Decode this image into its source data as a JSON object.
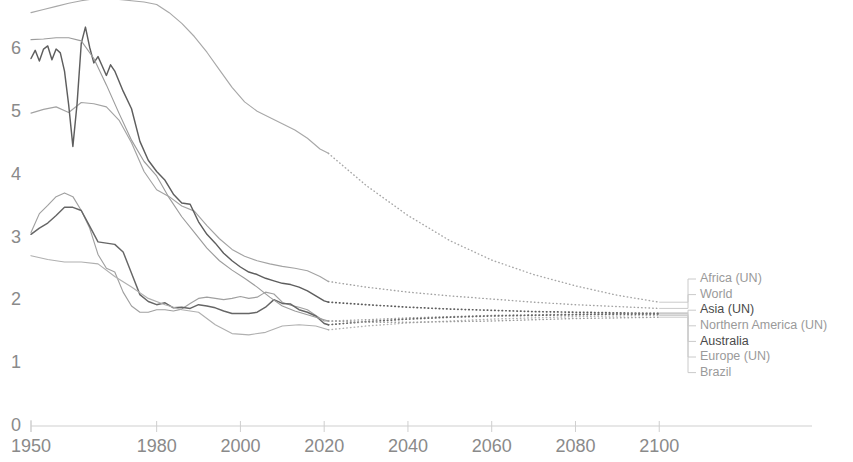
{
  "chart_data": {
    "type": "line",
    "title": "",
    "subtitle": "",
    "xlabel": "",
    "ylabel": "",
    "xlim": [
      1950,
      2104
    ],
    "ylim": [
      0,
      6.55
    ],
    "grid": false,
    "legend_position": "right",
    "x_ticks": [
      1950,
      1980,
      2000,
      2020,
      2040,
      2060,
      2080,
      2100
    ],
    "x_tick_labels": [
      "1950",
      "1980",
      "2000",
      "2020",
      "2040",
      "2060",
      "2080",
      "2100"
    ],
    "y_ticks": [
      0,
      1,
      2,
      3,
      4,
      5,
      6
    ],
    "y_tick_labels": [
      "0",
      "1",
      "2",
      "3",
      "4",
      "5",
      "6"
    ],
    "projection_start_year": 2021,
    "annotations": [
      "Solid lines show historical estimates; dotted lines show UN projections"
    ],
    "series": [
      {
        "name": "Africa (UN)",
        "label": "Africa (UN)",
        "color": "#a8a8a8",
        "emphasis": false,
        "x": [
          1950,
          1953,
          1956,
          1959,
          1962,
          1965,
          1968,
          1971,
          1974,
          1977,
          1980,
          1983,
          1986,
          1989,
          1992,
          1995,
          1998,
          2001,
          2004,
          2007,
          2010,
          2013,
          2016,
          2019,
          2021
        ],
        "values": [
          6.55,
          6.6,
          6.65,
          6.7,
          6.74,
          6.77,
          6.78,
          6.76,
          6.74,
          6.72,
          6.68,
          6.55,
          6.38,
          6.17,
          5.92,
          5.64,
          5.36,
          5.13,
          4.98,
          4.88,
          4.78,
          4.68,
          4.55,
          4.38,
          4.31
        ],
        "projection_x": [
          2021,
          2030,
          2040,
          2050,
          2060,
          2070,
          2080,
          2090,
          2100
        ],
        "projection_values": [
          4.31,
          3.8,
          3.32,
          2.92,
          2.61,
          2.38,
          2.2,
          2.05,
          1.94
        ]
      },
      {
        "name": "World",
        "label": "World",
        "color": "#a3a3a3",
        "emphasis": false,
        "x": [
          1950,
          1953,
          1956,
          1959,
          1962,
          1965,
          1968,
          1971,
          1974,
          1977,
          1980,
          1983,
          1986,
          1989,
          1992,
          1995,
          1998,
          2001,
          2004,
          2007,
          2010,
          2013,
          2016,
          2019,
          2021
        ],
        "values": [
          4.95,
          5.01,
          5.05,
          4.96,
          5.12,
          5.1,
          5.05,
          4.84,
          4.48,
          4.02,
          3.73,
          3.62,
          3.47,
          3.39,
          3.16,
          2.95,
          2.78,
          2.67,
          2.6,
          2.55,
          2.51,
          2.48,
          2.44,
          2.35,
          2.27
        ],
        "projection_x": [
          2021,
          2030,
          2040,
          2050,
          2060,
          2070,
          2080,
          2090,
          2100
        ],
        "projection_values": [
          2.27,
          2.18,
          2.1,
          2.04,
          1.99,
          1.94,
          1.9,
          1.87,
          1.84
        ]
      },
      {
        "name": "Asia (UN)",
        "label": "Asia (UN)",
        "color": "#5e5e5e",
        "emphasis": true,
        "x": [
          1950,
          1951,
          1952,
          1953,
          1954,
          1955,
          1956,
          1957,
          1958,
          1959,
          1960,
          1961,
          1962,
          1963,
          1964,
          1965,
          1966,
          1967,
          1968,
          1969,
          1970,
          1972,
          1974,
          1976,
          1978,
          1980,
          1982,
          1984,
          1986,
          1988,
          1990,
          1992,
          1994,
          1996,
          1998,
          2000,
          2002,
          2004,
          2006,
          2008,
          2010,
          2012,
          2014,
          2016,
          2018,
          2020,
          2021
        ],
        "values": [
          5.82,
          5.95,
          5.78,
          5.97,
          6.02,
          5.8,
          5.97,
          5.91,
          5.62,
          5.08,
          4.42,
          5.1,
          6.06,
          6.32,
          6.0,
          5.75,
          5.85,
          5.7,
          5.55,
          5.72,
          5.62,
          5.3,
          5.02,
          4.5,
          4.2,
          4.02,
          3.88,
          3.66,
          3.52,
          3.5,
          3.22,
          3.02,
          2.88,
          2.72,
          2.6,
          2.5,
          2.42,
          2.38,
          2.32,
          2.28,
          2.24,
          2.22,
          2.18,
          2.12,
          2.04,
          1.96,
          1.94
        ],
        "projection_x": [
          2021,
          2030,
          2040,
          2050,
          2060,
          2070,
          2080,
          2090,
          2100
        ],
        "projection_values": [
          1.94,
          1.9,
          1.86,
          1.83,
          1.81,
          1.79,
          1.78,
          1.77,
          1.76
        ]
      },
      {
        "name": "Northern America (UN)",
        "label": "Northern America (UN)",
        "color": "#a0a0a0",
        "emphasis": false,
        "x": [
          1950,
          1952,
          1954,
          1956,
          1958,
          1960,
          1962,
          1964,
          1966,
          1968,
          1970,
          1972,
          1974,
          1976,
          1978,
          1980,
          1982,
          1984,
          1986,
          1988,
          1990,
          1992,
          1994,
          1996,
          1998,
          2000,
          2002,
          2004,
          2006,
          2008,
          2010,
          2012,
          2014,
          2016,
          2018,
          2020,
          2021
        ],
        "values": [
          3.05,
          3.35,
          3.48,
          3.62,
          3.68,
          3.62,
          3.4,
          3.12,
          2.7,
          2.48,
          2.42,
          2.1,
          1.88,
          1.78,
          1.78,
          1.82,
          1.82,
          1.8,
          1.83,
          1.92,
          2.0,
          2.02,
          2.0,
          1.98,
          2.0,
          2.03,
          2.0,
          2.02,
          2.1,
          2.07,
          1.94,
          1.89,
          1.86,
          1.82,
          1.73,
          1.64,
          1.64
        ],
        "projection_x": [
          2021,
          2030,
          2040,
          2050,
          2060,
          2070,
          2080,
          2090,
          2100
        ],
        "projection_values": [
          1.64,
          1.66,
          1.69,
          1.71,
          1.73,
          1.74,
          1.75,
          1.76,
          1.77
        ]
      },
      {
        "name": "Australia",
        "label": "Australia",
        "color": "#666666",
        "emphasis": true,
        "x": [
          1950,
          1952,
          1954,
          1956,
          1958,
          1960,
          1962,
          1964,
          1966,
          1968,
          1970,
          1972,
          1974,
          1976,
          1978,
          1980,
          1982,
          1984,
          1986,
          1988,
          1990,
          1992,
          1994,
          1996,
          1998,
          2000,
          2002,
          2004,
          2006,
          2008,
          2010,
          2012,
          2014,
          2016,
          2018,
          2020,
          2021
        ],
        "values": [
          3.02,
          3.12,
          3.2,
          3.32,
          3.45,
          3.45,
          3.4,
          3.15,
          2.9,
          2.88,
          2.86,
          2.74,
          2.4,
          2.06,
          1.95,
          1.9,
          1.93,
          1.85,
          1.86,
          1.84,
          1.9,
          1.88,
          1.85,
          1.8,
          1.76,
          1.76,
          1.76,
          1.78,
          1.86,
          1.98,
          1.92,
          1.91,
          1.82,
          1.78,
          1.72,
          1.6,
          1.58
        ],
        "projection_x": [
          2021,
          2030,
          2040,
          2050,
          2060,
          2070,
          2080,
          2090,
          2100
        ],
        "projection_values": [
          1.58,
          1.63,
          1.67,
          1.7,
          1.72,
          1.73,
          1.74,
          1.75,
          1.75
        ]
      },
      {
        "name": "Europe (UN)",
        "label": "Europe (UN)",
        "color": "#b0b0b0",
        "emphasis": false,
        "x": [
          1950,
          1954,
          1958,
          1962,
          1966,
          1970,
          1974,
          1978,
          1982,
          1986,
          1990,
          1994,
          1998,
          2002,
          2006,
          2010,
          2014,
          2018,
          2021
        ],
        "values": [
          2.68,
          2.62,
          2.58,
          2.58,
          2.55,
          2.35,
          2.18,
          2.0,
          1.9,
          1.82,
          1.78,
          1.58,
          1.44,
          1.42,
          1.46,
          1.56,
          1.58,
          1.56,
          1.5
        ],
        "projection_x": [
          2021,
          2030,
          2040,
          2050,
          2060,
          2070,
          2080,
          2090,
          2100
        ],
        "projection_values": [
          1.5,
          1.56,
          1.61,
          1.64,
          1.67,
          1.69,
          1.71,
          1.72,
          1.73
        ]
      },
      {
        "name": "Brazil",
        "label": "Brazil",
        "color": "#9c9c9c",
        "emphasis": false,
        "x": [
          1950,
          1953,
          1956,
          1959,
          1962,
          1965,
          1968,
          1971,
          1974,
          1977,
          1980,
          1983,
          1986,
          1989,
          1992,
          1995,
          1998,
          2001,
          2004,
          2007,
          2010,
          2013,
          2016,
          2019,
          2021
        ],
        "values": [
          6.12,
          6.13,
          6.15,
          6.15,
          6.1,
          5.82,
          5.4,
          4.95,
          4.52,
          4.18,
          3.95,
          3.6,
          3.3,
          3.05,
          2.8,
          2.6,
          2.45,
          2.32,
          2.18,
          2.02,
          1.88,
          1.8,
          1.74,
          1.68,
          1.64
        ],
        "projection_x": [
          2021,
          2030,
          2040,
          2050,
          2060,
          2070,
          2080,
          2090,
          2100
        ],
        "projection_values": [
          1.64,
          1.62,
          1.62,
          1.63,
          1.64,
          1.66,
          1.68,
          1.69,
          1.7
        ]
      }
    ]
  },
  "legend": {
    "items": [
      {
        "label": "Africa (UN)",
        "color": "#a8a8a8",
        "strong": false
      },
      {
        "label": "World",
        "color": "#a3a3a3",
        "strong": false
      },
      {
        "label": "Asia (UN)",
        "color": "#5e5e5e",
        "strong": true
      },
      {
        "label": "Northern America (UN)",
        "color": "#a0a0a0",
        "strong": false
      },
      {
        "label": "Australia",
        "color": "#666666",
        "strong": true
      },
      {
        "label": "Europe (UN)",
        "color": "#b0b0b0",
        "strong": false
      },
      {
        "label": "Brazil",
        "color": "#9c9c9c",
        "strong": false
      }
    ]
  },
  "axes": {
    "y_labels": [
      "6",
      "5",
      "4",
      "3",
      "2",
      "1",
      "0"
    ],
    "x_labels": [
      "1950",
      "1980",
      "2000",
      "2020",
      "2040",
      "2060",
      "2080",
      "2100"
    ]
  }
}
